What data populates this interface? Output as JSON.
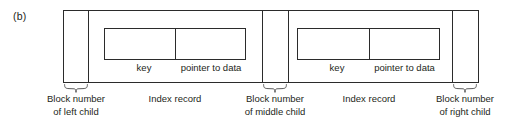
{
  "figure": {
    "label": "(b)",
    "type": "b-tree-index-node-diagram"
  },
  "node": {
    "cells": [
      {
        "kind": "block-number",
        "caption_line1": "Block number",
        "caption_line2": "of left child"
      },
      {
        "kind": "index-record",
        "caption": "Index record",
        "fields": [
          "key",
          "pointer to data"
        ]
      },
      {
        "kind": "block-number",
        "caption_line1": "Block number",
        "caption_line2": "of middle child"
      },
      {
        "kind": "index-record",
        "caption": "Index record",
        "fields": [
          "key",
          "pointer to data"
        ]
      },
      {
        "kind": "block-number",
        "caption_line1": "Block number",
        "caption_line2": "of right child"
      }
    ]
  },
  "labels": {
    "key": "key",
    "pointer_to_data": "pointer to data",
    "index_record": "Index record",
    "block_number": "Block number",
    "of_left_child": "of left child",
    "of_middle_child": "of middle child",
    "of_right_child": "of right child"
  },
  "colors": {
    "stroke": "#2b2b2b",
    "text": "#231f20",
    "background": "#ffffff",
    "brace": "#4a4a4a"
  }
}
